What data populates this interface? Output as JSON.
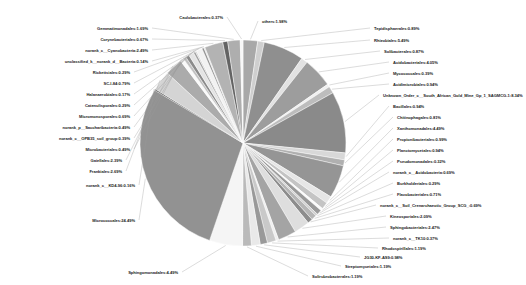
{
  "chart_data": {
    "type": "pie",
    "title": "",
    "subtitle": "",
    "xlabel": "",
    "ylabel": "",
    "legend_position": "none",
    "grid": false,
    "value_unit": "%",
    "label_format": "{name}:{value}%",
    "start_angle_deg": 90,
    "direction": "clockwise",
    "palette": "grayscale",
    "categories": [
      "others",
      "Tepidisphaerales",
      "Rhizobiales",
      "Solibacterales",
      "Acidobacteriales",
      "Mycococcales",
      "Acidimicrobiales",
      "Unknown_Order_c__South_African_Gold_Mine_Gp_1_SAGMCG-1",
      "Bacillales",
      "Chitinophagales",
      "Xanthomonadales",
      "Propionibacteriales",
      "Planctomycetales",
      "Pseudomonadales",
      "norank_c__Acidobacteria",
      "Burkholderiales",
      "Flavobacteriales",
      "norank_c__Soil_Crenarchaeotic_Group_SCG",
      "Kineosporiales",
      "Sphingobacteriales",
      "norank_c__TK10",
      "Rhodospirillales",
      "JG30-KF-AS9",
      "Streptomycetales",
      "Solirubrobacterales",
      "Sphingomonadales",
      "Micrococcales",
      "norank_c__KD4-96",
      "Frankiales",
      "Gaiellales",
      "Microbacteriales",
      "norank_c__OPB35_soil_group",
      "norank_p__Saccharibacteria",
      "Micromonosporales",
      "Catenulisporales",
      "Halanaerobiales",
      "SC-I-84",
      "Rickettsiales",
      "unclassified_k__norank_d__Bacteria",
      "norank_c__Cyanobacteria",
      "Corynebacteriales",
      "Gemmatimonadales",
      "Caulobacterales"
    ],
    "values": [
      1.98,
      0.89,
      5.49,
      0.87,
      4.05,
      0.39,
      0.94,
      8.34,
      0.94,
      0.81,
      4.49,
      0.99,
      0.94,
      0.32,
      0.69,
      0.29,
      0.71,
      0.69,
      2.09,
      2.47,
      0.37,
      1.19,
      0.98,
      1.19,
      1.19,
      4.49,
      24.49,
      0.16,
      2.69,
      2.39,
      0.49,
      0.39,
      0.49,
      0.69,
      0.29,
      0.17,
      0.79,
      0.29,
      0.14,
      2.49,
      0.67,
      1.69,
      0.37
    ],
    "labels": [
      "others:1.98%",
      "Tepidisphaerales:0.89%",
      "Rhizobiales:5.49%",
      "Solibacterales:0.87%",
      "Acidobacteriales:4.05%",
      "Mycococcales:0.39%",
      "Acidimicrobiales:0.94%",
      "Unknown_Order_c__South_African_Gold_Mine_Gp_1_SAGMCG-1:8.34%",
      "Bacillales:0.94%",
      "Chitinophagales:0.81%",
      "Xanthomonadales:4.49%",
      "Propionibacteriales:0.99%",
      "Planctomycetales:0.94%",
      "Pseudomonadales:0.32%",
      "norank_c__Acidobacteria:0.69%",
      "Burkholderiales:0.29%",
      "Flavobacteriales:0.71%",
      "norank_c__Soil_Crenarchaeotic_Group_SCG_:0.69%",
      "Kineosporiales:2.09%",
      "Sphingobacteriales:2.47%",
      "norank_c__TK10:0.37%",
      "Rhodospirillales:1.19%",
      "JG30-KF-AS9:0.98%",
      "Streptomycetales:1.19%",
      "Solirubrobacterales:1.19%",
      "Sphingomonadales:4.49%",
      "Micrococcales:24.49%",
      "norank_c__KD4-96:0.16%",
      "Frankiales:2.69%",
      "Gaiellales:2.39%",
      "Microbacteriales:0.49%",
      "norank_c__OPB35_soil_group:0.39%",
      "norank_p__Saccharibacteria:0.49%",
      "Micromonosporales:0.69%",
      "Catenulisporales:0.29%",
      "Halanaerobiales:0.17%",
      "SC-I-84:0.79%",
      "Rickettsiales:0.29%",
      "unclassified_k__norank_d__Bacteria:0.14%",
      "norank_c__Cyanobacteria:2.49%",
      "Corynebacteriales:0.67%",
      "Gemmatimonadales:1.69%",
      "Caulobacterales:0.37%"
    ],
    "colors": [
      "#a8a8a8",
      "#cfcfcf",
      "#8f8f8f",
      "#e2e2e2",
      "#9d9d9d",
      "#f0f0f0",
      "#bdbdbd",
      "#8a8a8a",
      "#d8d8d8",
      "#b0b0b0",
      "#959595",
      "#e6e6e6",
      "#c4c4c4",
      "#fbfbfb",
      "#9a9a9a",
      "#d0d0d0",
      "#b6b6b6",
      "#8d8d8d",
      "#dedede",
      "#a4a4a4",
      "#efefef",
      "#c9c9c9",
      "#999999",
      "#e9e9e9",
      "#bababa",
      "#f5f5f5",
      "#929292",
      "#1c1c1c",
      "#d4d4d4",
      "#ababab",
      "#fafafa",
      "#c0c0c0",
      "#8b8b8b",
      "#e4e4e4",
      "#a0a0a0",
      "#cccccc",
      "#f2f2f2",
      "#949494",
      "#dcdcdc",
      "#b3b3b3",
      "#636363",
      "#aeaeae",
      "#f7f7f7"
    ]
  }
}
